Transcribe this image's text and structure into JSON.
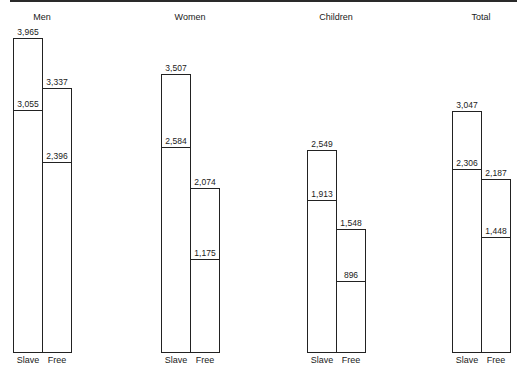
{
  "chart_data": {
    "type": "bar",
    "title": "",
    "groups": [
      "Men",
      "Women",
      "Children",
      "Total"
    ],
    "categories": [
      "Slave",
      "Free"
    ],
    "series": [
      {
        "name": "Upper value (outer bar)",
        "values": {
          "Men": [
            3965,
            3337
          ],
          "Women": [
            3507,
            2074
          ],
          "Children": [
            2549,
            1548
          ],
          "Total": [
            3047,
            2187
          ]
        }
      },
      {
        "name": "Lower value (inner line)",
        "values": {
          "Men": [
            3055,
            2396
          ],
          "Women": [
            2584,
            1175
          ],
          "Children": [
            1913,
            896
          ],
          "Total": [
            2306,
            1448
          ]
        }
      }
    ],
    "labels": {
      "Men": {
        "slave_top": "3,965",
        "slave_inner": "3,055",
        "free_top": "3,337",
        "free_inner": "2,396"
      },
      "Women": {
        "slave_top": "3,507",
        "slave_inner": "2,584",
        "free_top": "2,074",
        "free_inner": "1,175"
      },
      "Children": {
        "slave_top": "2,549",
        "slave_inner": "1,913",
        "free_top": "1,548",
        "free_inner": "896"
      },
      "Total": {
        "slave_top": "3,047",
        "slave_inner": "2,306",
        "free_top": "2,187",
        "free_inner": "1,448"
      }
    },
    "xlabel": "",
    "ylabel": "",
    "ylim": [
      0,
      4000
    ],
    "grid": false,
    "legend": "none"
  },
  "layout": {
    "baseline_y": 352,
    "px_per_unit": 0.0792,
    "bar_width": 29,
    "group_left_x": [
      13,
      161,
      307,
      452
    ]
  }
}
